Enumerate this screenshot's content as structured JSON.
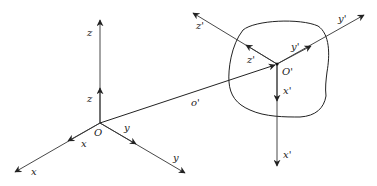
{
  "diagram": {
    "colors": {
      "line": "#222222",
      "body_outline": "#222222",
      "background": "#ffffff"
    },
    "origin_fixed": {
      "label": "O",
      "x": 100,
      "y": 123
    },
    "origin_body": {
      "label": "O'",
      "x": 277,
      "y": 64
    },
    "position_vector": {
      "label": "o'",
      "from": "O",
      "to": "O'"
    },
    "fixed_axes": [
      {
        "name": "z",
        "unit_label": "z",
        "axis_label": "z",
        "end": [
          100,
          20
        ],
        "unit_tip": [
          100,
          88
        ]
      },
      {
        "name": "x",
        "unit_label": "x",
        "axis_label": "x",
        "end": [
          15,
          172
        ],
        "unit_tip": [
          68,
          141
        ]
      },
      {
        "name": "y",
        "unit_label": "y",
        "axis_label": "y",
        "end": [
          185,
          173
        ],
        "unit_tip": [
          136,
          144
        ]
      }
    ],
    "body_axes": [
      {
        "name": "z'",
        "unit_label": "z'",
        "axis_label": "z'",
        "end": [
          193,
          13
        ],
        "unit_tip": [
          246,
          45
        ]
      },
      {
        "name": "y'",
        "unit_label": "y'",
        "axis_label": "y'",
        "end": [
          364,
          15
        ],
        "unit_tip": [
          311,
          46
        ]
      },
      {
        "name": "x'",
        "unit_label": "x'",
        "axis_label": "x'",
        "end": [
          277,
          166
        ],
        "unit_tip": [
          277,
          101
        ]
      }
    ]
  },
  "labels": {
    "O": "O",
    "O_prime": "O'",
    "o_prime": "o'",
    "z_unit": "z",
    "z_axis": "z",
    "x_unit": "x",
    "x_axis": "x",
    "y_unit": "y",
    "y_axis": "y",
    "zp_unit": "z'",
    "zp_axis": "z'",
    "yp_unit": "y'",
    "yp_axis": "y'",
    "xp_unit": "x'",
    "xp_axis": "x'"
  }
}
